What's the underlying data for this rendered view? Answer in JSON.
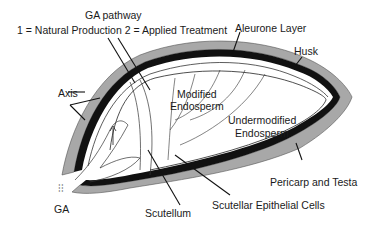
{
  "diagram": {
    "title": "GA pathway",
    "subtitle": "1 = Natural Production  2 = Applied Treatment",
    "labels": {
      "aleurone": "Aleurone Layer",
      "husk": "Husk",
      "axis": "Axis",
      "modified": "Modified",
      "modified2": "Endosperm",
      "undermodified": "Undermodified",
      "undermodified2": "Endosperm",
      "pericarp": "Pericarp and Testa",
      "scutellar": "Scutellar Epithelial Cells",
      "scutellum": "Scutellum",
      "ga": "GA"
    },
    "colors": {
      "husk": "#9a9a9a",
      "pericarp": "#111111",
      "line": "#222222"
    }
  }
}
